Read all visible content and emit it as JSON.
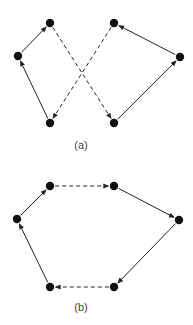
{
  "colors": {
    "node": "#111111",
    "edge": "#222222",
    "label": "#444444",
    "background": "#ffffff"
  },
  "panels": [
    {
      "id": "a",
      "label": "(a)",
      "label_pos": [
        81,
        149
      ],
      "nodes": [
        {
          "id": "a1",
          "x": 18,
          "y": 56
        },
        {
          "id": "a2",
          "x": 50,
          "y": 23
        },
        {
          "id": "a3",
          "x": 50,
          "y": 123
        },
        {
          "id": "a4",
          "x": 114,
          "y": 23
        },
        {
          "id": "a5",
          "x": 180,
          "y": 57
        },
        {
          "id": "a6",
          "x": 114,
          "y": 123
        }
      ],
      "edges": [
        {
          "from": "a3",
          "to": "a1",
          "style": "solid"
        },
        {
          "from": "a1",
          "to": "a2",
          "style": "solid"
        },
        {
          "from": "a2",
          "to": "a6",
          "style": "dashed"
        },
        {
          "from": "a6",
          "to": "a5",
          "style": "solid"
        },
        {
          "from": "a5",
          "to": "a4",
          "style": "solid"
        },
        {
          "from": "a4",
          "to": "a3",
          "style": "dashed"
        }
      ]
    },
    {
      "id": "b",
      "label": "(b)",
      "label_pos": [
        81,
        311
      ],
      "nodes": [
        {
          "id": "b1",
          "x": 17,
          "y": 219
        },
        {
          "id": "b2",
          "x": 50,
          "y": 186
        },
        {
          "id": "b3",
          "x": 114,
          "y": 186
        },
        {
          "id": "b4",
          "x": 179,
          "y": 220
        },
        {
          "id": "b5",
          "x": 114,
          "y": 287
        },
        {
          "id": "b6",
          "x": 50,
          "y": 287
        }
      ],
      "edges": [
        {
          "from": "b6",
          "to": "b1",
          "style": "solid"
        },
        {
          "from": "b1",
          "to": "b2",
          "style": "solid"
        },
        {
          "from": "b2",
          "to": "b3",
          "style": "dashed"
        },
        {
          "from": "b3",
          "to": "b4",
          "style": "solid"
        },
        {
          "from": "b4",
          "to": "b5",
          "style": "solid"
        },
        {
          "from": "b5",
          "to": "b6",
          "style": "dashed"
        }
      ]
    }
  ]
}
